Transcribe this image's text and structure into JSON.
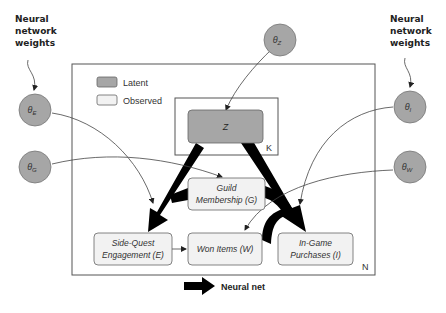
{
  "annotations": {
    "left_weights": [
      "Neural",
      "network",
      "weights"
    ],
    "right_weights": [
      "Neural",
      "network",
      "weights"
    ]
  },
  "legend": {
    "latent_label": "Latent",
    "observed_label": "Observed",
    "neural_net_label": "Neural net",
    "latent_color": "#a6a6a6",
    "observed_color": "#f2f2f2"
  },
  "plates": {
    "outer_label": "N",
    "inner_label": "K"
  },
  "params": {
    "theta_e": {
      "symbol": "θ",
      "sub": "E"
    },
    "theta_g": {
      "symbol": "θ",
      "sub": "G"
    },
    "theta_z": {
      "symbol": "θ",
      "sub": "Z"
    },
    "theta_i": {
      "symbol": "θ",
      "sub": "I"
    },
    "theta_w": {
      "symbol": "θ",
      "sub": "W"
    }
  },
  "nodes": {
    "z": {
      "label": "Z",
      "type": "latent"
    },
    "guild": {
      "line1": "Guild",
      "line2": "Membership (G)",
      "type": "observed"
    },
    "side_quest": {
      "line1": "Side-Quest",
      "line2": "Engagement (E)",
      "type": "observed"
    },
    "won_items": {
      "line1": "Won Items (W)",
      "type": "observed"
    },
    "in_game": {
      "line1": "In-Game",
      "line2": "Purchases (I)",
      "type": "observed"
    }
  },
  "edges": [
    {
      "from": "Z",
      "to": "Side-Quest Engagement (E)",
      "kind": "neural-net"
    },
    {
      "from": "Z",
      "to": "In-Game Purchases (I)",
      "kind": "neural-net"
    },
    {
      "from": "Guild Membership (G)",
      "to": "Side-Quest Engagement (E)",
      "kind": "neural-net"
    },
    {
      "from": "Guild Membership (G)",
      "to": "In-Game Purchases (I)",
      "kind": "neural-net"
    },
    {
      "from": "Won Items (W)",
      "to": "In-Game Purchases (I)",
      "kind": "neural-net"
    },
    {
      "from": "Side-Quest Engagement (E)",
      "to": "Won Items (W)",
      "kind": "plain"
    },
    {
      "from": "θZ",
      "to": "Z",
      "kind": "param"
    },
    {
      "from": "θE",
      "to": "Side-Quest Engagement (E)",
      "kind": "param"
    },
    {
      "from": "θG",
      "to": "Guild Membership (G)",
      "kind": "param"
    },
    {
      "from": "θI",
      "to": "In-Game Purchases (I)",
      "kind": "param"
    },
    {
      "from": "θW",
      "to": "Won Items (W)",
      "kind": "param"
    }
  ]
}
